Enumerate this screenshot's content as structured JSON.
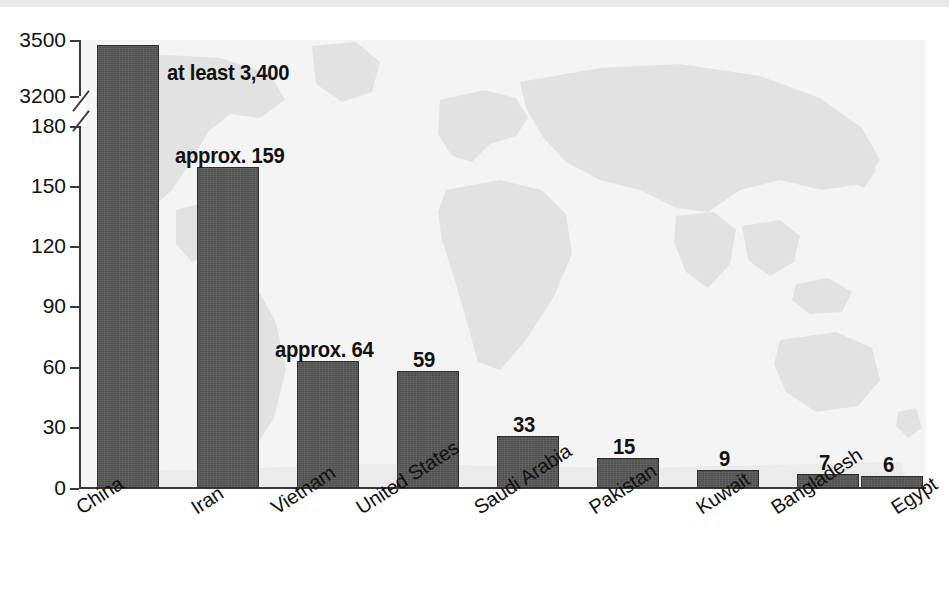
{
  "chart_data": {
    "type": "bar",
    "title": "",
    "subtitle": "",
    "xlabel": "",
    "ylabel": "",
    "categories": [
      "China",
      "Iran",
      "Vietnam",
      "United States",
      "Saudi Arabia",
      "Pakistan",
      "Kuwait",
      "Bangladesh",
      "Egypt"
    ],
    "values": [
      3400,
      159,
      64,
      59,
      33,
      15,
      9,
      7,
      6
    ],
    "data_labels": [
      "at least 3,400",
      "approx. 159",
      "approx. 64",
      "59",
      "33",
      "15",
      "9",
      "7",
      "6"
    ],
    "y_ticks": [
      "0",
      "30",
      "60",
      "90",
      "120",
      "150",
      "180",
      "3200",
      "3500"
    ],
    "y_tick_values": [
      0,
      30,
      60,
      90,
      120,
      150,
      180,
      3200,
      3500
    ],
    "ylim": [
      0,
      3500
    ],
    "axis_break": {
      "present": true,
      "between": [
        180,
        3200
      ],
      "style": "double-slash"
    },
    "grid": false,
    "legend": null,
    "legend_position": "none",
    "series": [
      {
        "name": "",
        "values": [
          3400,
          159,
          64,
          59,
          33,
          15,
          9,
          7,
          6
        ]
      }
    ],
    "background_watermark": "world-map",
    "colors": {
      "bar_fill": "#4d4d4d",
      "bar_stroke": "#2e2e2e",
      "axis": "#3a3a3a",
      "text": "#111111",
      "plot_background": "#f4f4f4",
      "watermark_land": "#e2e2e2",
      "page_background": "#ffffff"
    }
  },
  "axis": {
    "ticks": [
      {
        "label": "3500",
        "y": 40
      },
      {
        "label": "3200",
        "y": 96
      },
      {
        "label": "180",
        "y": 126
      },
      {
        "label": "150",
        "y": 186
      },
      {
        "label": "120",
        "y": 246
      },
      {
        "label": "90",
        "y": 306
      },
      {
        "label": "60",
        "y": 367
      },
      {
        "label": "30",
        "y": 427
      },
      {
        "label": "0",
        "y": 488
      }
    ]
  },
  "bars": [
    {
      "label": "China",
      "value_label": "at least 3,400",
      "x": 97,
      "w": 62,
      "top": 45,
      "label_x": 167,
      "label_y": 60
    },
    {
      "label": "Iran",
      "value_label": "approx. 159",
      "x": 197,
      "w": 62,
      "top": 167,
      "label_x": 175,
      "label_y": 143
    },
    {
      "label": "Vietnam",
      "value_label": "approx. 64",
      "x": 297,
      "w": 62,
      "top": 361,
      "label_x": 275,
      "label_y": 337
    },
    {
      "label": "United States",
      "value_label": "59",
      "x": 397,
      "w": 62,
      "top": 371,
      "label_x": 413,
      "label_y": 347
    },
    {
      "label": "Saudi Arabia",
      "value_label": "33",
      "x": 497,
      "w": 62,
      "top": 436,
      "label_x": 513,
      "label_y": 412
    },
    {
      "label": "Pakistan",
      "value_label": "15",
      "x": 597,
      "w": 62,
      "top": 458,
      "label_x": 613,
      "label_y": 434
    },
    {
      "label": "Kuwait",
      "value_label": "9",
      "x": 697,
      "w": 62,
      "top": 470,
      "label_x": 719,
      "label_y": 446
    },
    {
      "label": "Bangladesh",
      "value_label": "7",
      "x": 797,
      "w": 62,
      "top": 474,
      "label_x": 819,
      "label_y": 450
    },
    {
      "label": "Egypt",
      "value_label": "6",
      "x": 861,
      "w": 62,
      "top": 476,
      "label_x": 883,
      "label_y": 452
    }
  ],
  "category_labels": [
    {
      "text": "China",
      "x": 72,
      "y": 500
    },
    {
      "text": "Iran",
      "x": 187,
      "y": 500
    },
    {
      "text": "Vietnam",
      "x": 267,
      "y": 500
    },
    {
      "text": "United States",
      "x": 352,
      "y": 500
    },
    {
      "text": "Saudi Arabia",
      "x": 470,
      "y": 500
    },
    {
      "text": "Pakistan",
      "x": 585,
      "y": 500
    },
    {
      "text": "Kuwait",
      "x": 692,
      "y": 500
    },
    {
      "text": "Bangladesh",
      "x": 767,
      "y": 500
    },
    {
      "text": "Egypt",
      "x": 887,
      "y": 500
    }
  ]
}
